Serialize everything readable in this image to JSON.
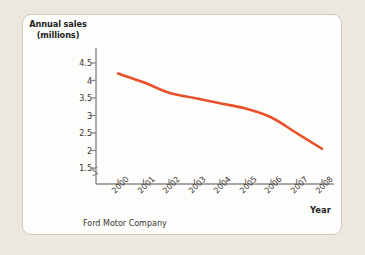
{
  "figure": {
    "background_color": "#ece8df",
    "panel_color": "#fdfdfc",
    "panel_border_color": "#cfcabd",
    "caption": "Ford Motor Company"
  },
  "chart_data": {
    "type": "line",
    "title": "",
    "subtitle": "",
    "xlabel": "Year",
    "ylabel": "Annual sales (millions)",
    "ylabel_line1": "Annual sales",
    "ylabel_line2": "(millions)",
    "categories": [
      "2000",
      "2001",
      "2002",
      "2003",
      "2004",
      "2005",
      "2006",
      "2007",
      "2008"
    ],
    "x": [
      2000,
      2001,
      2002,
      2003,
      2004,
      2005,
      2006,
      2007,
      2008
    ],
    "values": [
      4.2,
      3.95,
      3.65,
      3.5,
      3.35,
      3.2,
      2.95,
      2.5,
      2.05
    ],
    "series": [
      {
        "name": "Ford Motor Company",
        "color": "#e8512a",
        "values": [
          4.2,
          3.95,
          3.65,
          3.5,
          3.35,
          3.2,
          2.95,
          2.5,
          2.05
        ]
      }
    ],
    "yticks": [
      4.5,
      4,
      3.5,
      3,
      2.5,
      2,
      1.5
    ],
    "ytick_labels": [
      "4.5",
      "4",
      "3.5",
      "3",
      "2.5",
      "2",
      "1.5"
    ],
    "ylim": [
      1.5,
      4.5
    ],
    "xlim": [
      2000,
      2008
    ],
    "y_axis_break": true,
    "grid": false,
    "legend": false,
    "legend_position": "none",
    "line_color": "#e8512a",
    "axis_color": "#8a8a8a",
    "markers": false
  }
}
